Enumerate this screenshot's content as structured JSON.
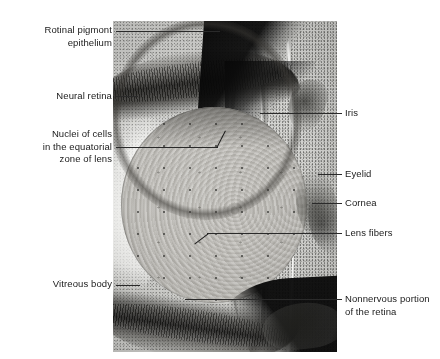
{
  "figure": {
    "type": "histology-micrograph",
    "background_color": "#ffffff",
    "label_color": "#1a1a1a",
    "leader_color": "#2a2a2a"
  },
  "labels": {
    "retinal_pigment_epithelium": "Rotinal pigmont\nepithelium",
    "neural_retina": "Neural retina",
    "nuclei_equatorial": "Nuclei of cells\nin the equatorial\nzone of lens",
    "vitreous_body": "Vitreous body",
    "iris": "Iris",
    "eyelid": "Eyelid",
    "cornea": "Cornea",
    "lens_fibers": "Lens fibers",
    "nonnervous_retina": "Nonnervous portion\nof the retina"
  }
}
